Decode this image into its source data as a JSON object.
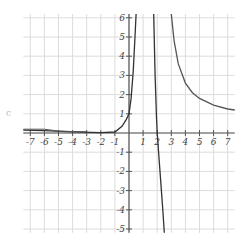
{
  "chart_data": {
    "type": "line",
    "title": "",
    "xlabel": "",
    "ylabel": "",
    "xlim": [
      -7.5,
      7.5
    ],
    "ylim": [
      -5.2,
      6.2
    ],
    "grid": true,
    "legend": null,
    "x_ticks": [
      -7,
      -6,
      -5,
      -4,
      -3,
      -2,
      -1,
      1,
      2,
      3,
      4,
      5,
      6,
      7
    ],
    "y_ticks": [
      -5,
      -4,
      -3,
      -2,
      -1,
      1,
      2,
      3,
      4,
      5,
      6
    ],
    "series": [
      {
        "name": "left-branch",
        "color": "#333333",
        "points": [
          [
            -7.5,
            0.15
          ],
          [
            -6,
            0.12
          ],
          [
            -4,
            0.06
          ],
          [
            -2,
            0.02
          ],
          [
            -1,
            0.05
          ],
          [
            -0.5,
            0.35
          ],
          [
            -0.2,
            0.7
          ],
          [
            0,
            1.0
          ],
          [
            0.15,
            1.8
          ],
          [
            0.3,
            3.2
          ],
          [
            0.4,
            4.6
          ],
          [
            0.5,
            6.2
          ]
        ]
      },
      {
        "name": "middle-branch",
        "color": "#333333",
        "points": [
          [
            1.75,
            6.2
          ],
          [
            1.85,
            3.0
          ],
          [
            1.95,
            0.8
          ],
          [
            2.0,
            0.0
          ],
          [
            2.1,
            -1.0
          ],
          [
            2.2,
            -2.0
          ],
          [
            2.3,
            -3.0
          ],
          [
            2.4,
            -4.0
          ],
          [
            2.5,
            -5.2
          ]
        ]
      },
      {
        "name": "right-branch",
        "color": "#555555",
        "points": [
          [
            3.0,
            6.2
          ],
          [
            3.2,
            4.8
          ],
          [
            3.5,
            3.6
          ],
          [
            4.0,
            2.6
          ],
          [
            4.5,
            2.1
          ],
          [
            5.0,
            1.8
          ],
          [
            6.0,
            1.45
          ],
          [
            7.0,
            1.25
          ],
          [
            7.5,
            1.2
          ]
        ]
      }
    ],
    "extra_line": {
      "name": "left-asymptote-line",
      "color": "#555555",
      "points": [
        [
          -7.5,
          0.2
        ],
        [
          -6.0,
          0.2
        ],
        [
          -5.0,
          0.1
        ],
        [
          -4.0,
          0.08
        ],
        [
          -3.0,
          0.06
        ]
      ]
    }
  },
  "stray_mark": "c"
}
